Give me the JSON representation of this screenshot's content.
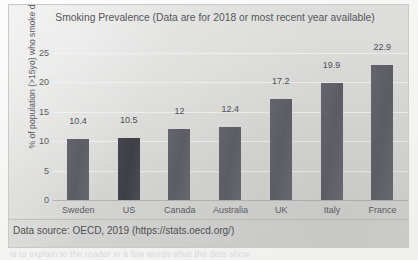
{
  "chart_data": {
    "type": "bar",
    "title": "Smoking Prevalence (Data are for 2018 or most recent year available)",
    "title_line1": "Smoking Prevalence (Data are for 2018 or most recent year",
    "title_line2": "available)",
    "xlabel": "",
    "ylabel": "% of population (>15yo) who smoke daily",
    "categories": [
      "Sweden",
      "US",
      "Canada",
      "Australia",
      "UK",
      "Italy",
      "France"
    ],
    "values": [
      10.4,
      10.5,
      12,
      12.4,
      17.2,
      19.9,
      22.9
    ],
    "value_labels": [
      "10.4",
      "10.5",
      "12",
      "12.4",
      "17.2",
      "19.9",
      "22.9"
    ],
    "ylim": [
      0,
      25
    ],
    "yticks": [
      0,
      5,
      10,
      15,
      20,
      25
    ],
    "ytick_labels": [
      "0",
      "5",
      "10",
      "15",
      "20",
      "25"
    ],
    "grid": true,
    "legend": "none",
    "bar_color": "#5c5c64",
    "plot_background": "#d9d9d7"
  },
  "footer": {
    "source": "Data source: OECD, 2019 (https://stats.oecd.org/)"
  },
  "background_text": {
    "bleed": "is to explain to the reader in a few words what the data show"
  }
}
